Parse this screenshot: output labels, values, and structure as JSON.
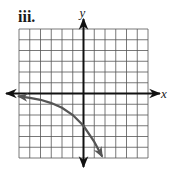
{
  "label": "iii.",
  "chart_data": {
    "type": "line",
    "title": "",
    "xlabel": "x",
    "ylabel": "y",
    "xlim": [
      -6,
      6
    ],
    "ylim": [
      -6,
      6
    ],
    "grid": true,
    "grid_step": 1,
    "tick_labels": false,
    "series": [
      {
        "name": "curve",
        "equation_estimate": "y = -3 * 1.5^x",
        "x": [
          -6,
          -5,
          -4,
          -3,
          -2,
          -1,
          0,
          1,
          1.7
        ],
        "values": [
          -0.26,
          -0.4,
          -0.59,
          -0.89,
          -1.33,
          -2.0,
          -3.0,
          -4.5,
          -5.8
        ],
        "arrow_both_ends": true,
        "color": "#555555"
      }
    ],
    "axis_color": "#111111",
    "grid_color": "#555555"
  }
}
